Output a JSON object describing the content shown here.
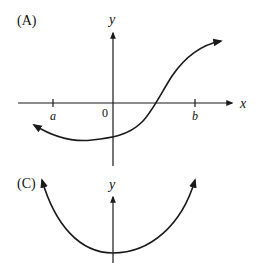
{
  "panels": [
    {
      "id": "A",
      "label": "(A)",
      "axes": {
        "x_label": "x",
        "y_label": "y"
      },
      "ticks": [
        {
          "label": "a",
          "position": "negative"
        },
        {
          "label": "0",
          "position": "origin"
        },
        {
          "label": "b",
          "position": "positive"
        }
      ],
      "curve": "S-shaped increasing curve, arrow at both ends, minimum left of origin, crosses x-axis between 0 and b"
    },
    {
      "id": "C",
      "label": "(C)",
      "axes": {
        "y_label": "y"
      },
      "curve": "U-shaped parabola-like curve with minimum at the y-axis, arrows at both ends pointing up"
    }
  ],
  "colors": {
    "stroke": "#1a1a1a",
    "background": "#ffffff"
  }
}
